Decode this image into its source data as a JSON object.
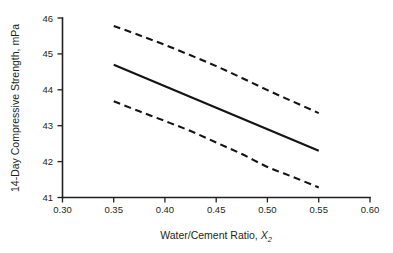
{
  "chart_data": {
    "type": "line",
    "title": "",
    "subtitle": "",
    "xlabel_prefix": "Water/Cement Ratio, ",
    "xlabel_symbol": "X",
    "xlabel_subscript": "2",
    "xlabel": "Water/Cement Ratio, X2",
    "ylabel": "14-Day Compressive Strength, mPa",
    "xlim": [
      0.3,
      0.6
    ],
    "ylim": [
      41,
      46
    ],
    "xticks": [
      0.3,
      0.35,
      0.4,
      0.45,
      0.5,
      0.55,
      0.6
    ],
    "xtick_labels": [
      "0.30",
      "0.35",
      "0.40",
      "0.45",
      "0.50",
      "0.55",
      "0.60"
    ],
    "yticks": [
      41,
      42,
      43,
      44,
      45,
      46
    ],
    "ytick_labels": [
      "41",
      "42",
      "43",
      "44",
      "45",
      "46"
    ],
    "grid": false,
    "legend": false,
    "legend_position": "none",
    "line_color": "#141414",
    "x": [
      0.35,
      0.375,
      0.4,
      0.425,
      0.45,
      0.475,
      0.5,
      0.525,
      0.55
    ],
    "series": [
      {
        "name": "Upper confidence limit",
        "style": "dashed",
        "values": [
          45.78,
          45.52,
          45.25,
          44.96,
          44.66,
          44.33,
          43.99,
          43.67,
          43.35
        ]
      },
      {
        "name": "Fitted regression line",
        "style": "solid",
        "values": [
          44.7,
          44.4,
          44.1,
          43.8,
          43.5,
          43.2,
          42.9,
          42.6,
          42.3
        ]
      },
      {
        "name": "Lower confidence limit",
        "style": "dashed",
        "values": [
          43.68,
          43.4,
          43.13,
          42.85,
          42.53,
          42.21,
          41.85,
          41.57,
          41.28
        ]
      }
    ]
  }
}
